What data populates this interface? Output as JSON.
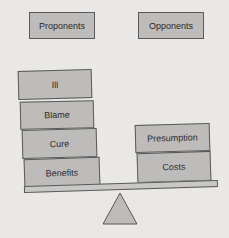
{
  "header": {
    "left_label": "Proponents",
    "right_label": "Opponents"
  },
  "scale": {
    "left_stack": [
      "Ill",
      "Blame",
      "Cure",
      "Benefits"
    ],
    "right_stack": [
      "Presumption",
      "Costs"
    ]
  },
  "colors": {
    "box_fill": "#bdbcba",
    "border": "#5a5a5a",
    "background": "#e9e8e6"
  }
}
